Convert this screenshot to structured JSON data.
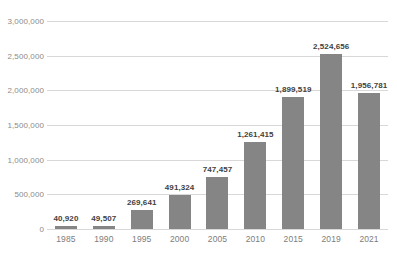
{
  "chart_data": {
    "type": "bar",
    "title": "",
    "xlabel": "",
    "ylabel": "",
    "categories": [
      "1985",
      "1990",
      "1995",
      "2000",
      "2005",
      "2010",
      "2015",
      "2019",
      "2021"
    ],
    "values": [
      40920,
      49507,
      269641,
      491324,
      747457,
      1261415,
      1899519,
      2524656,
      1956781
    ],
    "value_labels": [
      "40,920",
      "49,507",
      "269,641",
      "491,324",
      "747,457",
      "1,261,415",
      "1,899,519",
      "2,524,656",
      "1,956,781"
    ],
    "ylim": [
      0,
      3000000
    ],
    "y_ticks": [
      0,
      500000,
      1000000,
      1500000,
      2000000,
      2500000,
      3000000
    ],
    "y_tick_labels": [
      "0",
      "500,000",
      "1,000,000",
      "1,500,000",
      "2,000,000",
      "2,500,000",
      "3,000,000"
    ],
    "grid": true,
    "legend": false,
    "bar_color": "#858585",
    "gridline_color": "#d8d8d8",
    "value_label_color": "#3f3f3f",
    "tick_label_color": "#8a8a8a"
  }
}
